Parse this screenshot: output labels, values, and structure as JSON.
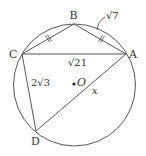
{
  "figure": {
    "type": "geometry-circle-inscribed-quadrilateral",
    "colors": {
      "stroke": "#555555",
      "text": "#333333",
      "background": "#ffffff"
    },
    "circle": {
      "center_label": "O",
      "cx": 74.5,
      "cy": 85,
      "r": 61
    },
    "points": {
      "A": {
        "label": "A",
        "x": 126,
        "y": 54
      },
      "B": {
        "label": "B",
        "x": 74,
        "y": 24
      },
      "C": {
        "label": "C",
        "x": 22,
        "y": 54
      },
      "D": {
        "label": "D",
        "x": 36,
        "y": 131
      }
    },
    "segments": [
      {
        "from": "C",
        "to": "B",
        "tick_marks": 2
      },
      {
        "from": "B",
        "to": "A",
        "tick_marks": 2,
        "length_label": "√7"
      },
      {
        "from": "C",
        "to": "A",
        "length_label": "√21"
      },
      {
        "from": "C",
        "to": "D",
        "length_label": "2√3"
      },
      {
        "from": "D",
        "to": "A",
        "length_label": "x"
      }
    ],
    "labels": {
      "a": "A",
      "b": "B",
      "c": "C",
      "d": "D",
      "o": "O",
      "ba_length": "√7",
      "ca_length": "√21",
      "cd_length": "2√3",
      "da_length": "x"
    }
  }
}
